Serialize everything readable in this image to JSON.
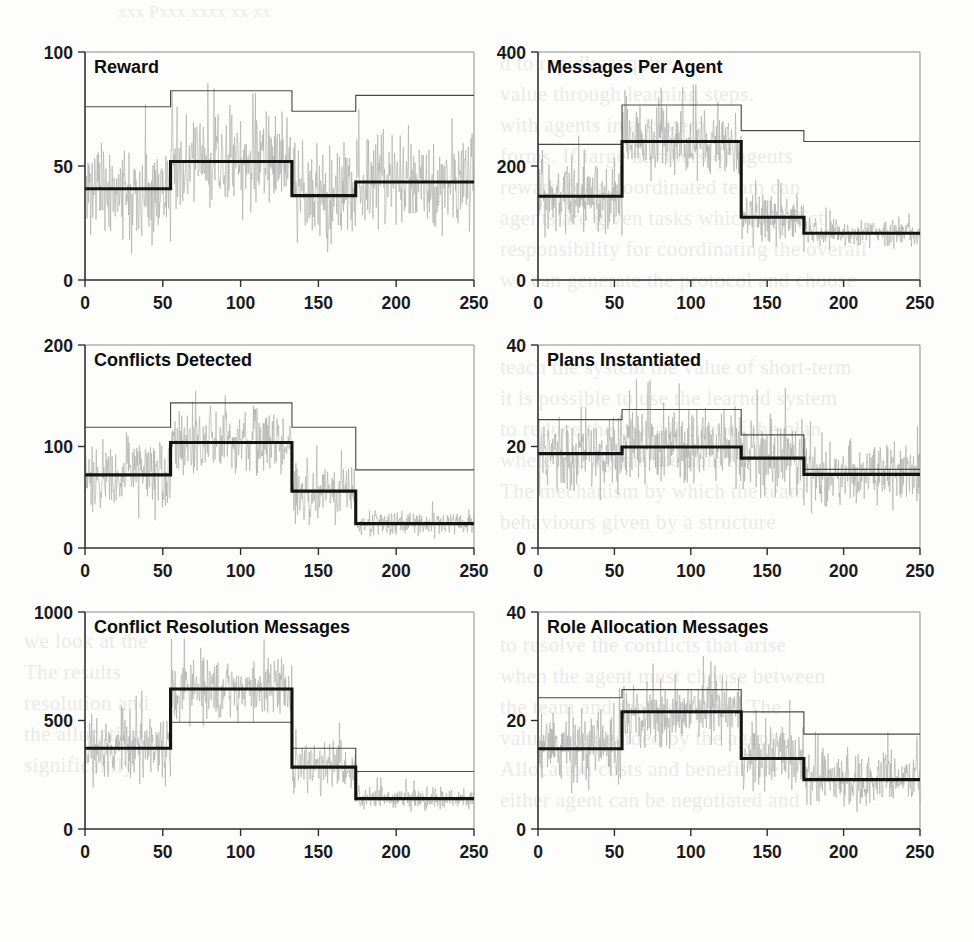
{
  "figure": {
    "kind": "multi-panel-figure",
    "panel_count": 6,
    "columns": 2,
    "rows": 3,
    "background_note": "scanned journal page with faint show-through text"
  },
  "ghost_text": {
    "header": "xxx      Pxxx xxxx xx xx",
    "right_top": "d to rapidly acquire\nvalue through learning steps.\nwith agents in a system\nforms. If large numbers of agents\nreward for a coordinated team can\nagents are given tasks which conflict\nresponsibility for coordinating the overall\nwe can generate the protocol and choose",
    "right_middle": "teach the system the value of short-term\nit is possible to use the learned system\nto reduce the overall cost of the plan\nwhere the agents are able to\nThe mechanism by which the team\nbehaviours given by a structure",
    "right_bottom": "to resolve the conflicts that arise\nwhen the agent must choose between\nthe team and the local goal. The\nvalues are decided by the agent\nAllocation costs and benefit are\neither agent can be negotiated and",
    "left_lower": "we look at the\nThe results\nresolution and\nthe allocation\nsignificantly"
  },
  "colors": {
    "noise": "#a9a9a9",
    "thin_line": "#4a4a4a",
    "thick_line": "#131313",
    "frame": "#8d8d8d",
    "axis": "#2e2e2e",
    "text": "#0d0d0d",
    "background": "#fdfdfc"
  },
  "chart_data": [
    {
      "id": "reward",
      "type": "line",
      "title": "Reward",
      "xlabel": "",
      "ylabel": "",
      "xlim": [
        0,
        250
      ],
      "ylim": [
        0,
        100
      ],
      "xticks": [
        0,
        50,
        100,
        150,
        200,
        250
      ],
      "yticks": [
        0,
        50,
        100
      ],
      "xtick_labels": [
        "0",
        "50",
        "100",
        "150",
        "200",
        "250"
      ],
      "ytick_labels": [
        "0",
        "50",
        "100"
      ],
      "grid": false,
      "legend": "none",
      "segment_breaks": [
        0,
        55,
        133,
        174,
        250
      ],
      "series": [
        {
          "name": "mean-thick",
          "style": "thick-step",
          "values": [
            40,
            52,
            37,
            43
          ]
        },
        {
          "name": "bound-thin",
          "style": "thin-step",
          "values": [
            76,
            83,
            74,
            81
          ]
        },
        {
          "name": "raw-noise",
          "style": "noise",
          "noise_center": [
            40,
            52,
            37,
            43
          ],
          "noise_spread": [
            30,
            30,
            30,
            30
          ],
          "seed": 11
        }
      ]
    },
    {
      "id": "messages-per-agent",
      "type": "line",
      "title": "Messages Per Agent",
      "xlabel": "",
      "ylabel": "",
      "xlim": [
        0,
        250
      ],
      "ylim": [
        0,
        400
      ],
      "xticks": [
        0,
        50,
        100,
        150,
        200,
        250
      ],
      "yticks": [
        0,
        200,
        400
      ],
      "xtick_labels": [
        "0",
        "50",
        "100",
        "150",
        "200",
        "250"
      ],
      "ytick_labels": [
        "0",
        "200",
        "400"
      ],
      "grid": false,
      "legend": "none",
      "segment_breaks": [
        0,
        55,
        133,
        174,
        250
      ],
      "series": [
        {
          "name": "mean-thick",
          "style": "thick-step",
          "values": [
            147,
            243,
            110,
            82
          ]
        },
        {
          "name": "bound-thin",
          "style": "thin-step",
          "values": [
            238,
            307,
            262,
            243
          ]
        },
        {
          "name": "raw-noise",
          "style": "noise",
          "noise_center": [
            147,
            243,
            110,
            82
          ],
          "noise_spread": [
            88,
            80,
            60,
            35
          ],
          "seed": 23
        }
      ]
    },
    {
      "id": "conflicts-detected",
      "type": "line",
      "title": "Conflicts Detected",
      "xlabel": "",
      "ylabel": "",
      "xlim": [
        0,
        250
      ],
      "ylim": [
        0,
        200
      ],
      "xticks": [
        0,
        50,
        100,
        150,
        200,
        250
      ],
      "yticks": [
        0,
        100,
        200
      ],
      "xtick_labels": [
        "0",
        "50",
        "100",
        "150",
        "200",
        "250"
      ],
      "ytick_labels": [
        "0",
        "100",
        "200"
      ],
      "grid": false,
      "legend": "none",
      "segment_breaks": [
        0,
        55,
        133,
        174,
        250
      ],
      "series": [
        {
          "name": "mean-thick",
          "style": "thick-step",
          "values": [
            72,
            104,
            56,
            24
          ]
        },
        {
          "name": "bound-thin",
          "style": "thin-step",
          "values": [
            119,
            143,
            119,
            77
          ]
        },
        {
          "name": "raw-noise",
          "style": "noise",
          "noise_center": [
            72,
            104,
            56,
            24
          ],
          "noise_spread": [
            52,
            48,
            42,
            18
          ],
          "seed": 37
        }
      ]
    },
    {
      "id": "plans-instantiated",
      "type": "line",
      "title": "Plans Instantiated",
      "xlabel": "",
      "ylabel": "",
      "xlim": [
        0,
        250
      ],
      "ylim": [
        0,
        40
      ],
      "xticks": [
        0,
        50,
        100,
        150,
        200,
        250
      ],
      "yticks": [
        0,
        20,
        40
      ],
      "xtick_labels": [
        "0",
        "50",
        "100",
        "150",
        "200",
        "250"
      ],
      "ytick_labels": [
        "0",
        "20",
        "40"
      ],
      "grid": false,
      "legend": "none",
      "segment_breaks": [
        0,
        55,
        133,
        174,
        250
      ],
      "series": [
        {
          "name": "mean-thick",
          "style": "thick-step",
          "values": [
            18.6,
            19.9,
            17.7,
            14.5
          ]
        },
        {
          "name": "bound-thin",
          "style": "thin-step",
          "values": [
            25.3,
            27.3,
            22.3,
            15.5
          ]
        },
        {
          "name": "raw-noise",
          "style": "noise",
          "noise_center": [
            18.6,
            19.9,
            17.7,
            14.5
          ],
          "noise_spread": [
            11,
            10.5,
            11,
            9
          ],
          "seed": 51
        }
      ]
    },
    {
      "id": "conflict-resolution-messages",
      "type": "line",
      "title": "Conflict Resolution Messages",
      "xlabel": "",
      "ylabel": "",
      "xlim": [
        0,
        250
      ],
      "ylim": [
        0,
        1000
      ],
      "xticks": [
        0,
        50,
        100,
        150,
        200,
        250
      ],
      "yticks": [
        0,
        500,
        1000
      ],
      "xtick_labels": [
        "0",
        "50",
        "100",
        "150",
        "200",
        "250"
      ],
      "ytick_labels": [
        "0",
        "500",
        "1000"
      ],
      "grid": false,
      "legend": "none",
      "segment_breaks": [
        0,
        55,
        133,
        174,
        250
      ],
      "series": [
        {
          "name": "mean-thick",
          "style": "thick-step",
          "values": [
            372,
            645,
            285,
            140
          ]
        },
        {
          "name": "bound-thin",
          "style": "thin-step",
          "values": [
            372,
            492,
            372,
            265
          ]
        },
        {
          "name": "raw-noise",
          "style": "noise",
          "noise_center": [
            372,
            645,
            285,
            140
          ],
          "noise_spread": [
            230,
            200,
            165,
            80
          ],
          "seed": 67
        }
      ]
    },
    {
      "id": "role-allocation-messages",
      "type": "line",
      "title": "Role Allocation Messages",
      "xlabel": "",
      "ylabel": "",
      "xlim": [
        0,
        250
      ],
      "ylim": [
        0,
        40
      ],
      "xticks": [
        0,
        50,
        100,
        150,
        200,
        250
      ],
      "yticks": [
        0,
        20,
        40
      ],
      "xtick_labels": [
        "0",
        "50",
        "100",
        "150",
        "200",
        "250"
      ],
      "ytick_labels": [
        "0",
        "20",
        "40"
      ],
      "grid": false,
      "legend": "none",
      "segment_breaks": [
        0,
        55,
        133,
        174,
        250
      ],
      "series": [
        {
          "name": "mean-thick",
          "style": "thick-step",
          "values": [
            14.8,
            21.6,
            13.0,
            9.1
          ]
        },
        {
          "name": "bound-thin",
          "style": "thin-step",
          "values": [
            24.2,
            25.7,
            21.6,
            17.5
          ]
        },
        {
          "name": "raw-noise",
          "style": "noise",
          "noise_center": [
            14.8,
            21.6,
            13.0,
            9.1
          ],
          "noise_spread": [
            9.5,
            9.5,
            9.5,
            7.0
          ],
          "seed": 83
        }
      ]
    }
  ]
}
